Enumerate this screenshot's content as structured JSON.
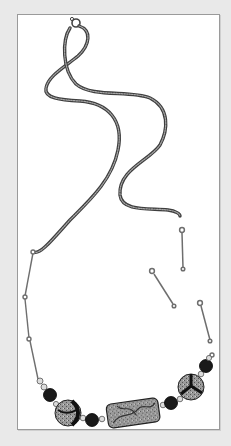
{
  "illustration": {
    "subject": "Beaded necklace with chain, clasp and loose eye-pin links",
    "colors": {
      "background": "#e9e9e9",
      "panel": "#ffffff",
      "panel_border": "#9a9a9a",
      "chain": "#6e6e6e",
      "wire": "#7a7a7a",
      "black_bead": "#1a1a1a",
      "pattern_bead": "#8c8c8c",
      "spacer_bead": "#d8d8d8"
    },
    "parts": [
      {
        "name": "spring-ring-clasp"
      },
      {
        "name": "snake-chain"
      },
      {
        "name": "eye-pin-link",
        "count": 3,
        "state": "loose"
      },
      {
        "name": "eye-pin-link",
        "count": 2,
        "state": "attached"
      },
      {
        "name": "black-round-bead",
        "count": 4
      },
      {
        "name": "round-patterned-bead",
        "count": 2
      },
      {
        "name": "tube-patterned-bead",
        "count": 1
      },
      {
        "name": "silver-spacer-bead",
        "count": 8
      }
    ]
  }
}
